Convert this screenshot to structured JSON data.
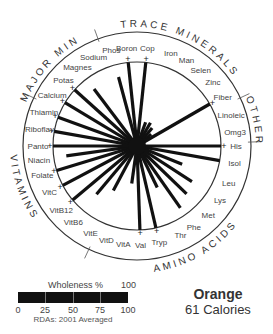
{
  "food": {
    "name": "Orange",
    "calories": "61 Calories"
  },
  "legend": {
    "title": "Wholeness %",
    "max_label": "100",
    "ticks": [
      "0",
      "25",
      "50",
      "75",
      "100"
    ],
    "note": "RDAs: 2001 Averaged"
  },
  "chart_data": {
    "type": "radial-bar",
    "categories_groups": [
      {
        "name": "MAJOR MIN",
        "items": [
          "Calcium",
          "Potas",
          "Magnes",
          "Sodium",
          "Phos"
        ]
      },
      {
        "name": "TRACE MINERALS",
        "items": [
          "Boron",
          "Cop",
          "Iron",
          "Man",
          "Selen",
          "Zinc"
        ]
      },
      {
        "name": "OTHER",
        "items": [
          "Fiber",
          "Linoleic",
          "Omg3"
        ]
      },
      {
        "name": "AMINO ACIDS",
        "items": [
          "His",
          "Isol",
          "Leu",
          "Lys",
          "Met",
          "Phe",
          "Thr",
          "Tryp",
          "Val"
        ]
      },
      {
        "name": "VITAMINS",
        "items": [
          "VitA",
          "VitD",
          "VitE",
          "VitB6",
          "VitB12",
          "VitC",
          "Folate",
          "Niacin",
          "Panto",
          "Riboflav",
          "Thiamin"
        ]
      }
    ],
    "nutrients": [
      {
        "label": "Boron",
        "angle": -96,
        "value": 100,
        "plus": true
      },
      {
        "label": "Cop",
        "angle": -84,
        "value": 100,
        "plus": true
      },
      {
        "label": "Iron",
        "angle": -70,
        "value": 30
      },
      {
        "label": "Man",
        "angle": -60,
        "value": 32
      },
      {
        "label": "Selen",
        "angle": -50,
        "value": 28
      },
      {
        "label": "Zinc",
        "angle": -40,
        "value": 22
      },
      {
        "label": "Fiber",
        "angle": -30,
        "value": 100,
        "plus": true
      },
      {
        "label": "Linoleic",
        "angle": -18,
        "value": 5
      },
      {
        "label": "Omg3",
        "angle": -8,
        "value": 5
      },
      {
        "label": "His",
        "angle": 0,
        "value": 100,
        "plus": true
      },
      {
        "label": "Isol",
        "angle": 10,
        "value": 100
      },
      {
        "label": "Leu",
        "angle": 22,
        "value": 58
      },
      {
        "label": "Lys",
        "angle": 33,
        "value": 78
      },
      {
        "label": "Met",
        "angle": 44,
        "value": 82
      },
      {
        "label": "Phe",
        "angle": 55,
        "value": 90
      },
      {
        "label": "Thr",
        "angle": 64,
        "value": 55
      },
      {
        "label": "Tryp",
        "angle": 77,
        "value": 100,
        "plus": true
      },
      {
        "label": "Val",
        "angle": 88,
        "value": 100,
        "plus": true
      },
      {
        "label": "VitA",
        "angle": 98,
        "value": 45
      },
      {
        "label": "VitD",
        "angle": 108,
        "value": 0
      },
      {
        "label": "VitE",
        "angle": 118,
        "value": 60
      },
      {
        "label": "VitB6",
        "angle": 130,
        "value": 75
      },
      {
        "label": "VitB12",
        "angle": 140,
        "value": 100,
        "plus": true
      },
      {
        "label": "VitC",
        "angle": 152,
        "value": 100,
        "plus": true
      },
      {
        "label": "Folate",
        "angle": 163,
        "value": 100,
        "plus": true
      },
      {
        "label": "Niacin",
        "angle": 172,
        "value": 85
      },
      {
        "label": "Panto",
        "angle": 180,
        "value": 100,
        "plus": true
      },
      {
        "label": "Riboflav",
        "angle": 190,
        "value": 100,
        "plus": true
      },
      {
        "label": "Thiamin",
        "angle": 200,
        "value": 100,
        "plus": true
      },
      {
        "label": "Calcium",
        "angle": 211,
        "value": 100,
        "plus": true
      },
      {
        "label": "Potas",
        "angle": 222,
        "value": 100,
        "plus": true
      },
      {
        "label": "Magnes",
        "angle": 233,
        "value": 85
      },
      {
        "label": "Sodium",
        "angle": 244,
        "value": 0
      },
      {
        "label": "Phos",
        "angle": 255,
        "value": 85
      }
    ],
    "center": [
      137,
      146
    ],
    "inner_radius": 84,
    "outer_radius": 114,
    "max_value": 100
  }
}
